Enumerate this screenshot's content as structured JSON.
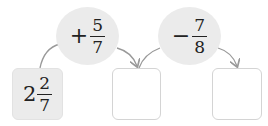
{
  "start_value": {
    "whole": "2",
    "numerator": "2",
    "denominator": "7"
  },
  "operations": [
    {
      "operator": "+",
      "numerator": "5",
      "denominator": "7"
    },
    {
      "operator": "−",
      "numerator": "7",
      "denominator": "8"
    }
  ],
  "answer_boxes": [
    {
      "value": ""
    },
    {
      "value": ""
    }
  ],
  "colors": {
    "fill": "#ebebeb",
    "border": "#d4d4d4",
    "arrow": "#999999"
  }
}
